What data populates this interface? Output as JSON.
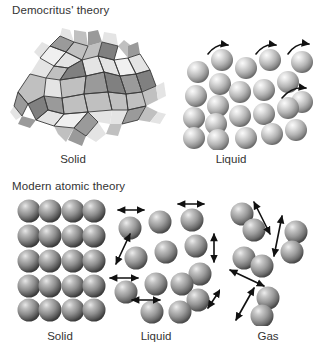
{
  "figure": {
    "background_color": "#ffffff",
    "sections": [
      {
        "id": "democritus",
        "title": "Democritus' theory",
        "panels": [
          {
            "id": "d-solid",
            "label": "Solid",
            "depiction": "irregular-interlocking-polyhedra-cluster"
          },
          {
            "id": "d-liquid",
            "label": "Liquid",
            "depiction": "packed-spheres-with-curved-motion-arrows"
          }
        ]
      },
      {
        "id": "modern",
        "title": "Modern atomic theory",
        "panels": [
          {
            "id": "m-solid",
            "label": "Solid",
            "depiction": "ordered-sphere-lattice-grid"
          },
          {
            "id": "m-liquid",
            "label": "Liquid",
            "depiction": "loose-spheres-with-double-headed-vibration-arrows"
          },
          {
            "id": "m-gas",
            "label": "Gas",
            "depiction": "sparse-sphere-pairs-with-long-double-headed-arrows"
          }
        ]
      }
    ]
  },
  "colors": {
    "text": "#333333",
    "background": "#ffffff",
    "sphere_light_highlight": "#f2f2f2",
    "sphere_light_mid": "#b9b9b9",
    "sphere_light_shadow": "#6e6e6e",
    "sphere_dark_highlight": "#dcdcdc",
    "sphere_dark_mid": "#8c8c8c",
    "sphere_dark_shadow": "#3c3c3c",
    "polyhedron_light": "#e2e2e2",
    "polyhedron_mid": "#b0b0b0",
    "polyhedron_dark": "#8a8a8a",
    "polyhedron_edge": "#3a3a3a",
    "arrow": "#111111"
  },
  "counts": {
    "democritus_liquid_spheres": 20,
    "democritus_liquid_arrows": 4,
    "modern_solid_rows": 5,
    "modern_solid_columns": 4,
    "modern_solid_spheres": 20,
    "modern_liquid_spheres": 13,
    "modern_liquid_arrows": 6,
    "modern_gas_spheres": 8,
    "modern_gas_arrows": 4
  }
}
